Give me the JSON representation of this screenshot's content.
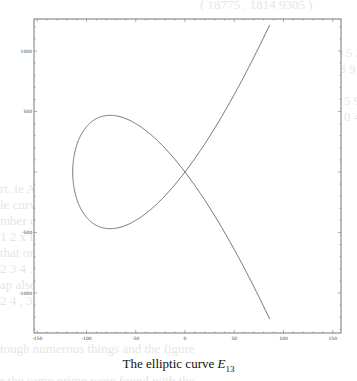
{
  "chart_data": {
    "type": "line",
    "title": "",
    "caption": "The elliptic curve E13",
    "caption_text": "The elliptic curve ",
    "caption_symbol": "E",
    "caption_subscript": "13",
    "xlabel": "",
    "ylabel": "",
    "xlim": [
      -150,
      160
    ],
    "ylim": [
      -1300,
      1250
    ],
    "xticks": [
      -150,
      -100,
      -50,
      0,
      50,
      100,
      150
    ],
    "yticks": [
      1000,
      500,
      0,
      -500,
      -1000
    ],
    "xtick_labels": [
      "-150",
      "-100",
      "-50",
      "0",
      "50",
      "100",
      "150"
    ],
    "ytick_labels": [
      "1000",
      "500",
      "0",
      "-500",
      "-1000"
    ],
    "grid": false,
    "legend": null,
    "series": [
      {
        "name": "E13 (nodal cubic, approx. y^2 = x^2 (x + 114))",
        "x": [
          -114,
          -110,
          -100,
          -90,
          -79,
          -60,
          -40,
          -20,
          0,
          20,
          40,
          60,
          86
        ],
        "y_upper": [
          0,
          220,
          374,
          443,
          468,
          442,
          352,
          184,
          0,
          -219,
          -491,
          -812,
          -1216
        ],
        "y_lower": [
          0,
          -220,
          -374,
          -443,
          -468,
          -442,
          -352,
          -184,
          0,
          219,
          491,
          812,
          1216
        ]
      }
    ],
    "annotations": [
      "node (self-intersection) at approx. (0, 0)"
    ]
  },
  "figure": {
    "caption": "The elliptic curve E13"
  }
}
